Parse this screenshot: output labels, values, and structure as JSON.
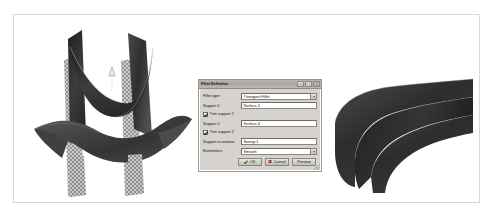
{
  "figure": {
    "caption": "",
    "left_model": {
      "name": "input-surfaces-preview",
      "description": "Two intersecting dark swept surfaces with two checkered support planes and an upward direction arrow",
      "arrow_label": "",
      "surface_color": "#3a3a3a",
      "plane_color": "#9b9b9b"
    },
    "right_model": {
      "name": "tritangent-fillet-result",
      "description": "Resulting U-shaped tritangent fillet surface",
      "surface_color": "#323232"
    }
  },
  "dialog": {
    "title": "Fillet Definition",
    "window_buttons": [
      {
        "name": "minimize",
        "glyph": "–"
      },
      {
        "name": "maximize",
        "glyph": "□"
      },
      {
        "name": "close",
        "glyph": "×"
      }
    ],
    "fields": {
      "fillet_type": {
        "label": "Fillet type:",
        "value": "Tritangent Fillet"
      },
      "support1": {
        "label": "Support 1:",
        "value": "Surface.2"
      },
      "trim_support1": {
        "label": "Trim support 1",
        "checked": true
      },
      "support2": {
        "label": "Support 2:",
        "value": "Surface.4"
      },
      "trim_support2": {
        "label": "Trim support 2",
        "checked": true
      },
      "support_to_remove": {
        "label": "Support to remove:",
        "value": "Sweep.1"
      },
      "extremities": {
        "label": "Extremities:",
        "value": "Smooth"
      }
    },
    "buttons": {
      "ok": "OK",
      "cancel": "Cancel",
      "preview": "Preview"
    }
  }
}
